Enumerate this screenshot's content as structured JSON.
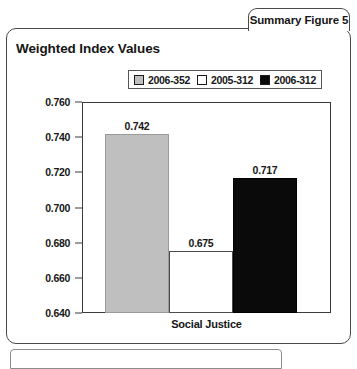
{
  "tab": {
    "label": "Summary Figure 5"
  },
  "card": {
    "title": "Weighted Index Values"
  },
  "chart_data": {
    "type": "bar",
    "title": "Weighted Index Values",
    "xlabel": "Social Justice",
    "ylabel": "",
    "categories": [
      "Social Justice"
    ],
    "ylim": [
      0.64,
      0.76
    ],
    "ytick_labels": [
      "0.760",
      "0.740",
      "0.720",
      "0.700",
      "0.680",
      "0.660",
      "0.640"
    ],
    "yticks": [
      0.76,
      0.74,
      0.72,
      0.7,
      0.68,
      0.66,
      0.64
    ],
    "grid": false,
    "legend_position": "top",
    "series": [
      {
        "name": "2006-352",
        "values": [
          0.742
        ],
        "value_label": "0.742",
        "color": "#bfbfbf"
      },
      {
        "name": "2005-312",
        "values": [
          0.675
        ],
        "value_label": "0.675",
        "color": "#ffffff"
      },
      {
        "name": "2006-312",
        "values": [
          0.717
        ],
        "value_label": "0.717",
        "color": "#0a0a0a"
      }
    ]
  }
}
